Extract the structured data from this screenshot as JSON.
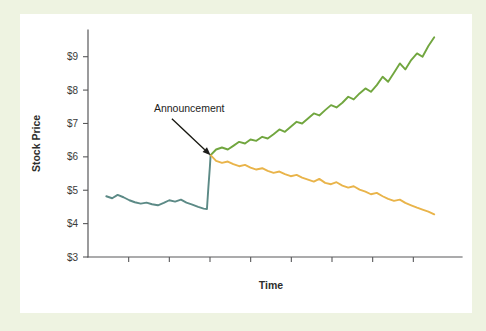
{
  "figure": {
    "background_color": "#eef3e1",
    "canvas_color": "#ffffff"
  },
  "chart_data": {
    "type": "line",
    "title": "",
    "subtitle": "",
    "xlabel": "Time",
    "ylabel": "Stock Price",
    "ylim": [
      3,
      9.8
    ],
    "xlim": [
      0,
      100
    ],
    "y_tick_labels": [
      "$3",
      "$4",
      "$5",
      "$6",
      "$7",
      "$8",
      "$9"
    ],
    "y_tick_values": [
      3,
      4,
      5,
      6,
      7,
      8,
      9
    ],
    "x_tick_labels": [],
    "x_tick_count": 8,
    "grid": false,
    "legend": null,
    "legend_position": "none",
    "annotations": [
      {
        "text": "Announcement",
        "text_x": 18,
        "text_y": 7.35,
        "arrow_to_x": 33.5,
        "arrow_to_y": 6.05,
        "color": "#1d1d1b"
      }
    ],
    "series": [
      {
        "name": "pre-announcement",
        "color": "#5c8a86",
        "x": [
          5.0,
          6.6,
          8.1,
          9.7,
          11.3,
          12.8,
          14.4,
          16.0,
          17.5,
          19.1,
          20.7,
          22.2,
          23.8,
          25.4,
          26.9,
          28.5,
          30.1,
          31.6,
          32.5,
          32.9,
          33.3,
          33.5
        ],
        "y": [
          4.82,
          4.76,
          4.86,
          4.79,
          4.7,
          4.64,
          4.6,
          4.63,
          4.58,
          4.55,
          4.62,
          4.7,
          4.66,
          4.72,
          4.63,
          4.57,
          4.5,
          4.45,
          4.44,
          5.1,
          5.7,
          6.05
        ]
      },
      {
        "name": "positive-outcome",
        "color": "#71a63f",
        "x": [
          33.5,
          35.0,
          36.6,
          38.2,
          39.7,
          41.3,
          42.9,
          44.4,
          46.0,
          47.6,
          49.1,
          50.7,
          52.3,
          53.8,
          55.4,
          57.0,
          58.5,
          60.1,
          61.7,
          63.2,
          64.8,
          66.4,
          67.9,
          69.5,
          71.1,
          72.6,
          74.2,
          75.8,
          77.3,
          78.9,
          80.5,
          82.0,
          83.6,
          85.2,
          86.7,
          88.3,
          89.9,
          91.4,
          93.0,
          94.6
        ],
        "y": [
          6.05,
          6.22,
          6.28,
          6.22,
          6.33,
          6.45,
          6.4,
          6.52,
          6.48,
          6.6,
          6.55,
          6.68,
          6.82,
          6.75,
          6.9,
          7.05,
          7.0,
          7.15,
          7.3,
          7.24,
          7.4,
          7.55,
          7.48,
          7.62,
          7.8,
          7.72,
          7.9,
          8.05,
          7.95,
          8.15,
          8.4,
          8.25,
          8.52,
          8.8,
          8.62,
          8.9,
          9.1,
          9.0,
          9.32,
          9.58
        ]
      },
      {
        "name": "negative-outcome",
        "color": "#e9b44a",
        "x": [
          33.5,
          35.0,
          36.6,
          38.2,
          39.7,
          41.3,
          42.9,
          44.4,
          46.0,
          47.6,
          49.1,
          50.7,
          52.3,
          53.8,
          55.4,
          57.0,
          58.5,
          60.1,
          61.7,
          63.2,
          64.8,
          66.4,
          67.9,
          69.5,
          71.1,
          72.6,
          74.2,
          75.8,
          77.3,
          78.9,
          80.5,
          82.0,
          83.6,
          85.2,
          86.7,
          88.3,
          89.9,
          91.4,
          93.0,
          94.6
        ],
        "y": [
          6.05,
          5.88,
          5.82,
          5.86,
          5.78,
          5.72,
          5.76,
          5.68,
          5.62,
          5.66,
          5.58,
          5.52,
          5.56,
          5.48,
          5.42,
          5.46,
          5.38,
          5.32,
          5.26,
          5.34,
          5.22,
          5.18,
          5.24,
          5.14,
          5.08,
          5.12,
          5.02,
          4.96,
          4.88,
          4.92,
          4.82,
          4.74,
          4.68,
          4.72,
          4.62,
          4.55,
          4.48,
          4.42,
          4.36,
          4.28
        ]
      }
    ]
  }
}
